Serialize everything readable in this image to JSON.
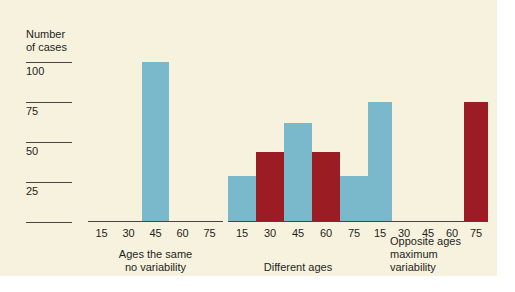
{
  "figure": {
    "background_color": "#f7f2de",
    "page_color": "#ffffff",
    "blue_color": "#7ab8cc",
    "red_color": "#9b1c22"
  },
  "yaxis": {
    "title": "Number\nof cases",
    "ticks": [
      {
        "label": "100",
        "value": 100
      },
      {
        "label": "75",
        "value": 75
      },
      {
        "label": "50",
        "value": 50
      },
      {
        "label": "25",
        "value": 25
      },
      {
        "label": "",
        "value": 0
      }
    ]
  },
  "chart_data": {
    "type": "bar",
    "title": "",
    "xlabel": "",
    "ylabel": "Number of cases",
    "ylim": [
      0,
      100
    ],
    "grid": false,
    "legend": "none",
    "categories": [
      "15",
      "30",
      "45",
      "60",
      "75"
    ],
    "panels": [
      {
        "caption": "Ages the same\nno variability",
        "caption_align": "center",
        "categories": [
          "15",
          "30",
          "45",
          "60",
          "75"
        ],
        "values": [
          0,
          0,
          100,
          0,
          0
        ],
        "colors": [
          "none",
          "none",
          "#7ab8cc",
          "none",
          "none"
        ]
      },
      {
        "caption": "Different ages",
        "caption_align": "center",
        "categories": [
          "15",
          "30",
          "45",
          "60",
          "75"
        ],
        "values": [
          29,
          44,
          62,
          44,
          29
        ],
        "colors": [
          "#7ab8cc",
          "#9b1c22",
          "#7ab8cc",
          "#9b1c22",
          "#7ab8cc"
        ]
      },
      {
        "caption": "Opposite ages\nmaximum\nvariability",
        "caption_align": "left",
        "categories": [
          "15",
          "30",
          "45",
          "60",
          "75"
        ],
        "values": [
          75,
          0,
          0,
          0,
          75
        ],
        "colors": [
          "#7ab8cc",
          "none",
          "none",
          "none",
          "#9b1c22"
        ]
      }
    ]
  },
  "panel_labels": {
    "panel1_caption": "Ages the same\nno variability",
    "panel2_caption": "Different ages",
    "panel3_caption": "Opposite ages\nmaximum\nvariability"
  },
  "xticks": {
    "p0": [
      "15",
      "30",
      "45",
      "60",
      "75"
    ],
    "p1": [
      "15",
      "30",
      "45",
      "60",
      "75"
    ],
    "p2": [
      "15",
      "30",
      "45",
      "60",
      "75"
    ]
  }
}
